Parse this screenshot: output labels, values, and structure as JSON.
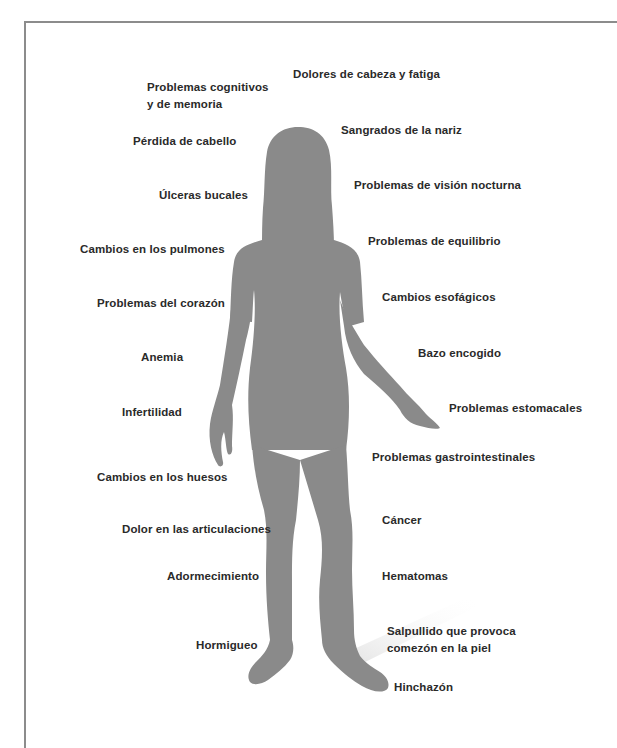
{
  "diagram": {
    "figure": "female-body-silhouette",
    "silhouette_color": "#8a8a8a",
    "text_color": "#2a2a2a",
    "left_labels": [
      {
        "lines": [
          "Problemas cognitivos",
          "y de memoria"
        ]
      },
      {
        "lines": [
          "Pérdida de cabello"
        ]
      },
      {
        "lines": [
          "Úlceras bucales"
        ]
      },
      {
        "lines": [
          "Cambios en los pulmones"
        ]
      },
      {
        "lines": [
          "Problemas del corazón"
        ]
      },
      {
        "lines": [
          "Anemia"
        ]
      },
      {
        "lines": [
          "Infertilidad"
        ]
      },
      {
        "lines": [
          "Cambios en los huesos"
        ]
      },
      {
        "lines": [
          "Dolor en las articulaciones"
        ]
      },
      {
        "lines": [
          "Adormecimiento"
        ]
      },
      {
        "lines": [
          "Hormigueo"
        ]
      }
    ],
    "right_labels": [
      {
        "lines": [
          "Dolores de cabeza y fatiga"
        ]
      },
      {
        "lines": [
          "Sangrados de la nariz"
        ]
      },
      {
        "lines": [
          "Problemas de visión nocturna"
        ]
      },
      {
        "lines": [
          "Problemas de equilibrio"
        ]
      },
      {
        "lines": [
          "Cambios esofágicos"
        ]
      },
      {
        "lines": [
          "Bazo encogido"
        ]
      },
      {
        "lines": [
          "Problemas estomacales"
        ]
      },
      {
        "lines": [
          "Problemas gastrointestinales"
        ]
      },
      {
        "lines": [
          "Cáncer"
        ]
      },
      {
        "lines": [
          "Hematomas"
        ]
      },
      {
        "lines": [
          "Salpullido que provoca",
          "comezón en la piel"
        ]
      },
      {
        "lines": [
          "Hinchazón"
        ]
      }
    ]
  }
}
